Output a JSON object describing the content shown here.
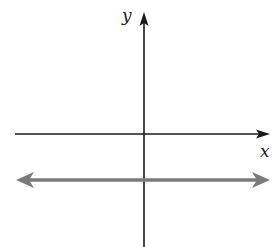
{
  "diagram": {
    "type": "coordinate-plane",
    "x_axis_label": "x",
    "y_axis_label": "y",
    "colors": {
      "axes": "#1a1a1a",
      "line": "#7a7a7a",
      "background": "#ffffff"
    },
    "graphed_line": {
      "description": "horizontal line below the x-axis with arrows at both ends",
      "equation_form": "y = c, c < 0"
    }
  }
}
